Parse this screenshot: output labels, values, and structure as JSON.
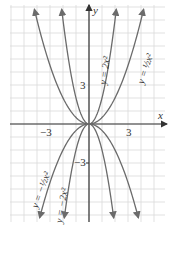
{
  "chart_data": {
    "type": "line",
    "title": "",
    "xlabel": "x",
    "ylabel": "y",
    "xlim": [
      -6,
      5.8
    ],
    "ylim": [
      -7.5,
      9.3
    ],
    "grid": true,
    "tick_labels": {
      "x": [
        "-3",
        "3"
      ],
      "y": [
        "3",
        "-3"
      ]
    },
    "series": [
      {
        "name": "y = 2x^2",
        "label": "y = 2x²",
        "coef": 2,
        "x": [
          -2.1,
          -1.5,
          -1,
          -0.5,
          0,
          0.5,
          1,
          1.5,
          2.1
        ],
        "values": [
          8.82,
          4.5,
          2,
          0.5,
          0,
          0.5,
          2,
          4.5,
          8.82
        ]
      },
      {
        "name": "y = 1/2 x^2",
        "label": "y = ½x²",
        "coef": 0.5,
        "x": [
          -4.2,
          -3,
          -2,
          -1,
          0,
          1,
          2,
          3,
          4.2
        ],
        "values": [
          8.82,
          4.5,
          2,
          0.5,
          0,
          0.5,
          2,
          4.5,
          8.82
        ]
      },
      {
        "name": "y = -2x^2",
        "label": "y = −2x²",
        "coef": -2,
        "x": [
          -1.9,
          -1.5,
          -1,
          -0.5,
          0,
          0.5,
          1,
          1.5,
          1.9
        ],
        "values": [
          -7.22,
          -4.5,
          -2,
          -0.5,
          0,
          -0.5,
          -2,
          -4.5,
          -7.22
        ]
      },
      {
        "name": "y = -1/2 x^2",
        "label": "y = −½x²",
        "coef": -0.5,
        "x": [
          -3.8,
          -3,
          -2,
          -1,
          0,
          1,
          2,
          3,
          3.8
        ],
        "values": [
          -7.22,
          -4.5,
          -2,
          -0.5,
          0,
          -0.5,
          -2,
          -4.5,
          -7.22
        ]
      }
    ]
  },
  "labels": {
    "x_axis": "x",
    "y_axis": "y",
    "x_neg": "−3",
    "x_pos": "3",
    "y_pos": "3",
    "y_neg": "−3",
    "curve_2x2": "y = 2x²",
    "curve_half_x2": "y = ½x²",
    "curve_neg_2x2": "y = −2x²",
    "curve_neg_half_x2": "y = −½x²"
  },
  "colors": {
    "curve": "#6b6b6b",
    "axis": "#333333",
    "grid": "#d9d9d9"
  }
}
